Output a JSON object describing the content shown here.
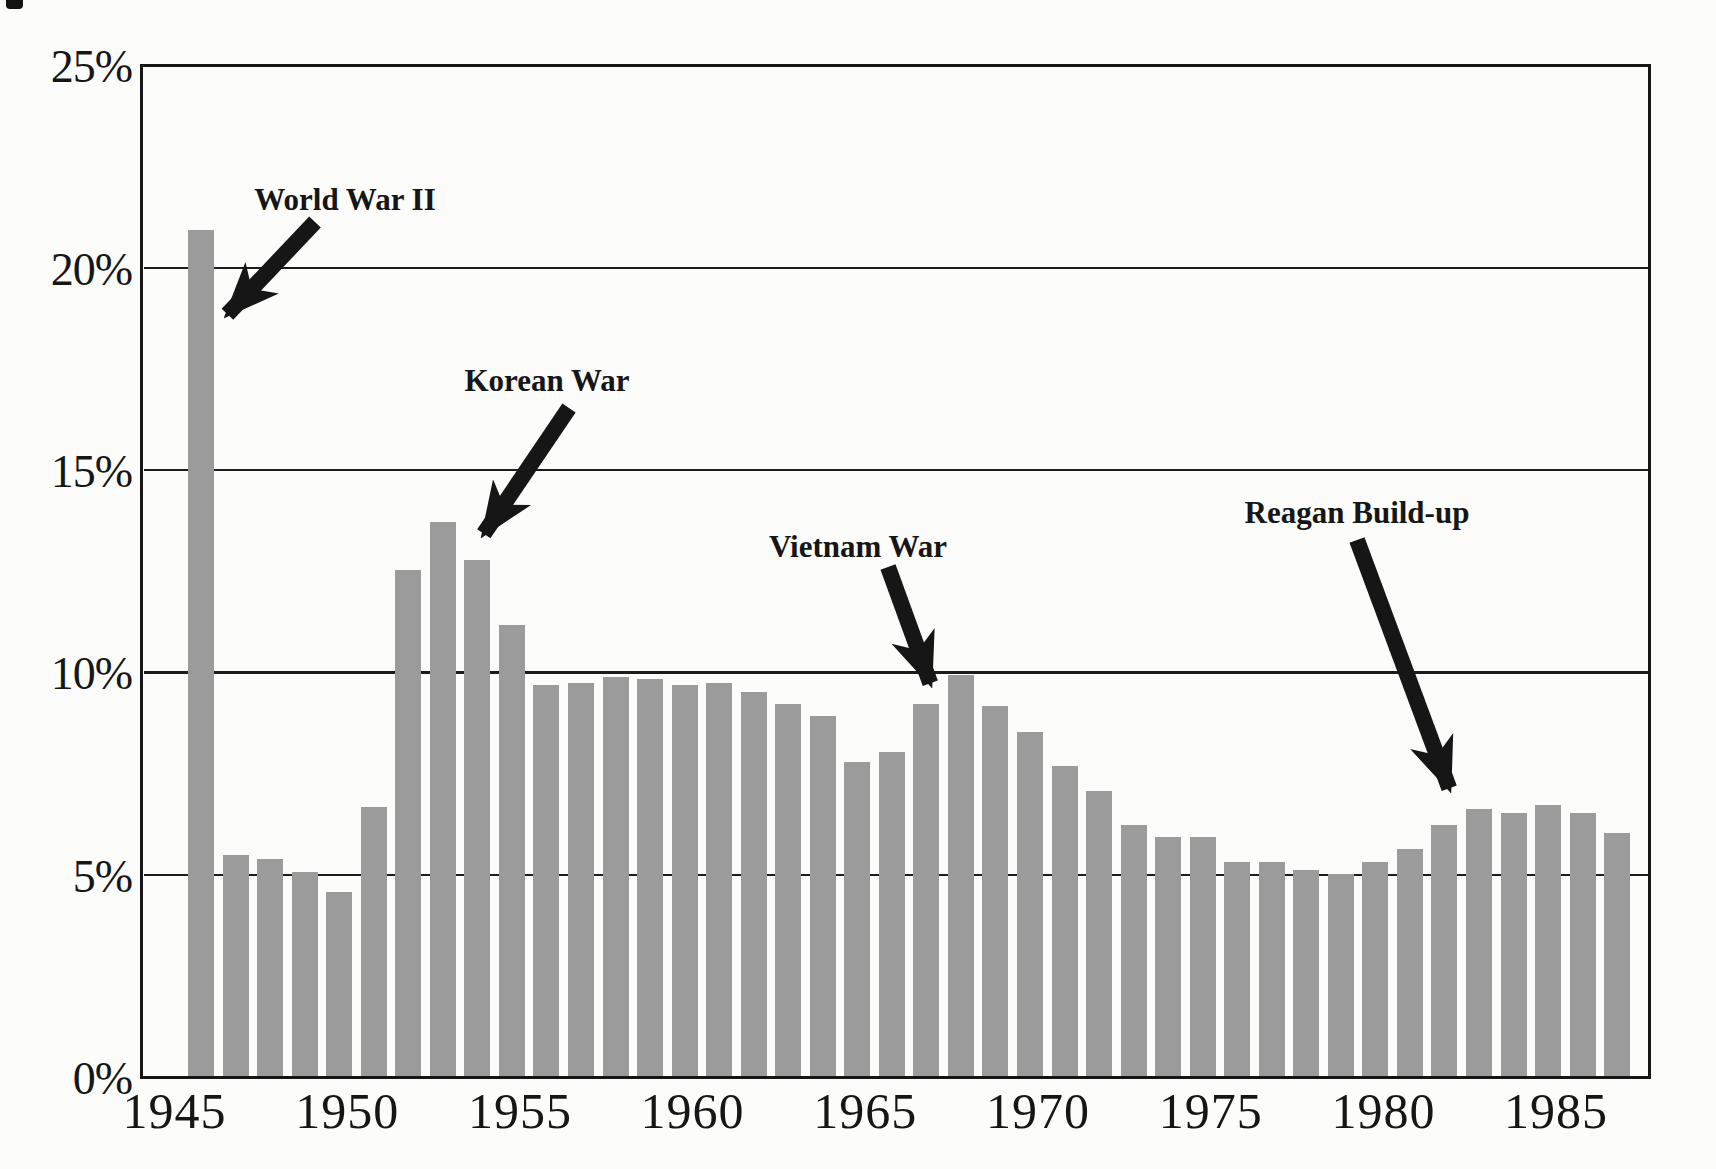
{
  "page": {
    "background": "#fcfcfb"
  },
  "chart_data": {
    "type": "bar",
    "title": "",
    "xlabel": "",
    "ylabel": "",
    "ylim": [
      0,
      25
    ],
    "grid": "horizontal",
    "bar_color": "#9b9b9b",
    "line_color": "#161616",
    "background_color": "#fcfcfb",
    "categories": [
      1946,
      1947,
      1948,
      1949,
      1950,
      1951,
      1952,
      1953,
      1954,
      1955,
      1956,
      1957,
      1958,
      1959,
      1960,
      1961,
      1962,
      1963,
      1964,
      1965,
      1966,
      1967,
      1968,
      1969,
      1970,
      1971,
      1972,
      1973,
      1974,
      1975,
      1976,
      1977,
      1978,
      1979,
      1980,
      1981,
      1982,
      1983,
      1984,
      1985,
      1986,
      1987
    ],
    "values": [
      20.9,
      5.45,
      5.35,
      5.05,
      4.55,
      6.65,
      12.5,
      13.7,
      12.75,
      11.15,
      9.65,
      9.7,
      9.85,
      9.8,
      9.65,
      9.7,
      9.5,
      9.2,
      8.9,
      7.75,
      8.0,
      9.2,
      9.9,
      9.15,
      8.5,
      7.65,
      7.05,
      6.2,
      5.9,
      5.9,
      5.3,
      5.3,
      5.1,
      5.0,
      5.3,
      5.6,
      6.2,
      6.6,
      6.5,
      6.7,
      6.5,
      6.0
    ],
    "yticks": [
      {
        "label": "25%",
        "value": 25
      },
      {
        "label": "20%",
        "value": 20
      },
      {
        "label": "15%",
        "value": 15
      },
      {
        "label": "10%",
        "value": 10
      },
      {
        "label": "5%",
        "value": 5
      },
      {
        "label": "0%",
        "value": 0
      }
    ],
    "xticks": [
      {
        "label": "1945",
        "year": 1945
      },
      {
        "label": "1950",
        "year": 1950
      },
      {
        "label": "1955",
        "year": 1955
      },
      {
        "label": "1960",
        "year": 1960
      },
      {
        "label": "1965",
        "year": 1965
      },
      {
        "label": "1970",
        "year": 1970
      },
      {
        "label": "1975",
        "year": 1975
      },
      {
        "label": "1980",
        "year": 1980
      },
      {
        "label": "1985",
        "year": 1985
      }
    ],
    "gridline_values": [
      5,
      10,
      15,
      20
    ],
    "annotations": [
      {
        "id": "world-war-ii",
        "text": "World War II",
        "target_year": 1946,
        "label_x": 345,
        "label_y": 200,
        "arrow": {
          "x1": 315,
          "y1": 222,
          "x2": 224,
          "y2": 318
        }
      },
      {
        "id": "korean-war",
        "text": "Korean War",
        "target_year": 1953,
        "label_x": 547,
        "label_y": 381,
        "arrow": {
          "x1": 569,
          "y1": 408,
          "x2": 481,
          "y2": 538
        }
      },
      {
        "id": "vietnam-war",
        "text": "Vietnam War",
        "target_year": 1967,
        "label_x": 858,
        "label_y": 547,
        "arrow": {
          "x1": 888,
          "y1": 567,
          "x2": 932,
          "y2": 688
        }
      },
      {
        "id": "reagan-build-up",
        "text": "Reagan Build-up",
        "target_year": 1982,
        "label_x": 1357,
        "label_y": 513,
        "arrow": {
          "x1": 1357,
          "y1": 540,
          "x2": 1451,
          "y2": 793
        }
      }
    ]
  }
}
